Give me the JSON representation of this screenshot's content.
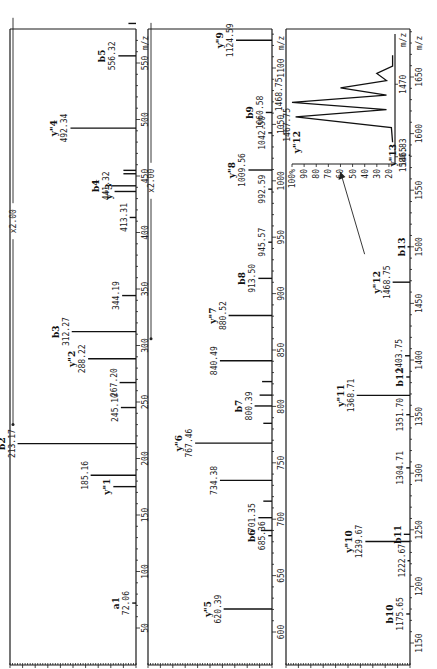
{
  "chart_data": {
    "type": "bar",
    "title": "",
    "xlabel": "m/z",
    "ylabel": "Relative intensity (%)",
    "grid": false,
    "orientation": "rotated-90-ccw",
    "y_ticks": [
      "0",
      "10",
      "20",
      "30",
      "40",
      "50",
      "60",
      "70",
      "80",
      "90",
      "100%"
    ],
    "panels": [
      {
        "xlim": [
          40,
          590
        ],
        "ylim": [
          0,
          100
        ],
        "x_ticks": [
          "50",
          "100",
          "150",
          "200",
          "250",
          "300",
          "350",
          "400",
          "450",
          "500",
          "550"
        ],
        "x_tick_values": [
          50,
          100,
          150,
          200,
          250,
          300,
          350,
          400,
          450,
          500,
          550
        ],
        "xlabel": "m/z",
        "magnification": {
          "label": "x2.00",
          "from": 230,
          "to": 590
        },
        "peaks": [
          {
            "mz": 72.06,
            "intensity": 3,
            "value_label": "72.06",
            "ion": "a1"
          },
          {
            "mz": 175.1,
            "intensity": 18,
            "value_label": "",
            "ion": "y\"1"
          },
          {
            "mz": 185.16,
            "intensity": 36,
            "value_label": "185.16",
            "ion": ""
          },
          {
            "mz": 213.17,
            "intensity": 94,
            "value_label": "213.17",
            "ion": "b2"
          },
          {
            "mz": 245.1,
            "intensity": 12,
            "value_label": "245.10",
            "ion": ""
          },
          {
            "mz": 267.2,
            "intensity": 13,
            "value_label": "267.20",
            "ion": ""
          },
          {
            "mz": 288.22,
            "intensity": 38,
            "value_label": "288.22",
            "ion": "y\"2"
          },
          {
            "mz": 312.27,
            "intensity": 51,
            "value_label": "312.27",
            "ion": "b3"
          },
          {
            "mz": 344.19,
            "intensity": 11,
            "value_label": "344.19",
            "ion": ""
          },
          {
            "mz": 413.31,
            "intensity": 5,
            "value_label": "413.31",
            "ion": ""
          },
          {
            "mz": 436.3,
            "intensity": 17,
            "value_label": "",
            "ion": "y\"3"
          },
          {
            "mz": 441.32,
            "intensity": 19,
            "value_label": "441.32",
            "ion": "b4"
          },
          {
            "mz": 452.0,
            "intensity": 10,
            "value_label": "",
            "ion": ""
          },
          {
            "mz": 455.0,
            "intensity": 10,
            "value_label": "",
            "ion": ""
          },
          {
            "mz": 492.34,
            "intensity": 52,
            "value_label": "492.34",
            "ion": "y\"4"
          },
          {
            "mz": 556.32,
            "intensity": 14,
            "value_label": "556.32",
            "ion": "b5"
          },
          {
            "mz": 585.0,
            "intensity": 6,
            "value_label": "",
            "ion": ""
          }
        ]
      },
      {
        "xlim": [
          590,
          1140
        ],
        "ylim": [
          0,
          100
        ],
        "x_ticks": [
          "600",
          "650",
          "700",
          "750",
          "800",
          "850",
          "900",
          "950",
          "1000",
          "1050",
          "1100"
        ],
        "x_tick_values": [
          600,
          650,
          700,
          750,
          800,
          850,
          900,
          950,
          1000,
          1050,
          1100
        ],
        "xlabel": "m/z",
        "magnification": {
          "label": "x2.00",
          "from": 860,
          "to": 1140
        },
        "peaks": [
          {
            "mz": 620.39,
            "intensity": 39,
            "value_label": "620.39",
            "ion": "y\"5"
          },
          {
            "mz": 685.36,
            "intensity": 3,
            "value_label": "685.36",
            "ion": "b6"
          },
          {
            "mz": 690.0,
            "intensity": 9,
            "value_label": "",
            "ion": ""
          },
          {
            "mz": 701.35,
            "intensity": 11,
            "value_label": "701.35",
            "ion": ""
          },
          {
            "mz": 716.0,
            "intensity": 7,
            "value_label": "",
            "ion": ""
          },
          {
            "mz": 734.38,
            "intensity": 42,
            "value_label": "734.38",
            "ion": ""
          },
          {
            "mz": 767.46,
            "intensity": 62,
            "value_label": "767.46",
            "ion": "y\"6"
          },
          {
            "mz": 785.0,
            "intensity": 7,
            "value_label": "",
            "ion": ""
          },
          {
            "mz": 800.39,
            "intensity": 14,
            "value_label": "800.39",
            "ion": "b7"
          },
          {
            "mz": 810.0,
            "intensity": 10,
            "value_label": "",
            "ion": ""
          },
          {
            "mz": 822.0,
            "intensity": 8,
            "value_label": "",
            "ion": ""
          },
          {
            "mz": 840.49,
            "intensity": 42,
            "value_label": "840.49",
            "ion": ""
          },
          {
            "mz": 880.52,
            "intensity": 35,
            "value_label": "880.52",
            "ion": "y\"7"
          },
          {
            "mz": 913.5,
            "intensity": 11,
            "value_label": "913.50",
            "ion": "b8"
          },
          {
            "mz": 945.57,
            "intensity": 3,
            "value_label": "945.57",
            "ion": ""
          },
          {
            "mz": 992.59,
            "intensity": 3,
            "value_label": "992.59",
            "ion": ""
          },
          {
            "mz": 1009.56,
            "intensity": 19,
            "value_label": "1009.56",
            "ion": "y\"8"
          },
          {
            "mz": 1042.5,
            "intensity": 3,
            "value_label": "1042.50",
            "ion": ""
          },
          {
            "mz": 1060.58,
            "intensity": 5,
            "value_label": "1060.58",
            "ion": "b9"
          },
          {
            "mz": 1124.59,
            "intensity": 29,
            "value_label": "1124.59",
            "ion": "y\"9"
          }
        ]
      },
      {
        "xlim": [
          1140,
          1690
        ],
        "ylim": [
          0,
          100
        ],
        "x_ticks": [
          "1150",
          "1200",
          "1250",
          "1300",
          "1350",
          "1400",
          "1450",
          "1500",
          "1550",
          "1600",
          "1650"
        ],
        "x_tick_values": [
          1150,
          1200,
          1250,
          1300,
          1350,
          1400,
          1450,
          1500,
          1550,
          1600,
          1650
        ],
        "xlabel": "m/z",
        "magnification": null,
        "peaks": [
          {
            "mz": 1175.65,
            "intensity": 3,
            "value_label": "1175.65",
            "ion": "b10"
          },
          {
            "mz": 1222.67,
            "intensity": 2,
            "value_label": "1222.67",
            "ion": ""
          },
          {
            "mz": 1239.67,
            "intensity": 36,
            "value_label": "1239.67",
            "ion": "y\"10"
          },
          {
            "mz": 1246.0,
            "intensity": 5,
            "value_label": "",
            "ion": "b11"
          },
          {
            "mz": 1304.71,
            "intensity": 3,
            "value_label": "1304.71",
            "ion": ""
          },
          {
            "mz": 1351.7,
            "intensity": 3,
            "value_label": "1351.70",
            "ion": ""
          },
          {
            "mz": 1368.71,
            "intensity": 43,
            "value_label": "1368.71",
            "ion": "y\"11"
          },
          {
            "mz": 1385.0,
            "intensity": 3,
            "value_label": "",
            "ion": "b12"
          },
          {
            "mz": 1403.75,
            "intensity": 4,
            "value_label": "1403.75",
            "ion": ""
          },
          {
            "mz": 1468.75,
            "intensity": 14,
            "value_label": "1468.75",
            "ion": "y\"12"
          },
          {
            "mz": 1500.0,
            "intensity": 2,
            "value_label": "",
            "ion": "b13"
          },
          {
            "mz": 1580.83,
            "intensity": 1,
            "value_label": "1580.83",
            "ion": "y\"13"
          }
        ],
        "inset": {
          "xlabel": "m/z",
          "x_ticks": [
            "1465",
            "1470"
          ],
          "y_ticks": [
            "20",
            "30",
            "40",
            "50",
            "60",
            "70",
            "80",
            "90",
            "100%"
          ],
          "ylim": [
            15,
            100
          ],
          "peak_labels": [
            {
              "mz": 1467.75,
              "label": "1467.75",
              "ion": "y\"12"
            },
            {
              "mz": 1468.75,
              "label": "1468.75",
              "ion": ""
            }
          ],
          "isotope_profile": [
            {
              "mz": 1466.0,
              "intensity": 17
            },
            {
              "mz": 1467.0,
              "intensity": 18
            },
            {
              "mz": 1467.75,
              "intensity": 97
            },
            {
              "mz": 1468.25,
              "intensity": 22
            },
            {
              "mz": 1468.75,
              "intensity": 100
            },
            {
              "mz": 1469.25,
              "intensity": 22
            },
            {
              "mz": 1469.75,
              "intensity": 60
            },
            {
              "mz": 1470.25,
              "intensity": 22
            },
            {
              "mz": 1470.75,
              "intensity": 30
            },
            {
              "mz": 1471.25,
              "intensity": 17
            },
            {
              "mz": 1472.0,
              "intensity": 17
            }
          ]
        }
      }
    ]
  }
}
